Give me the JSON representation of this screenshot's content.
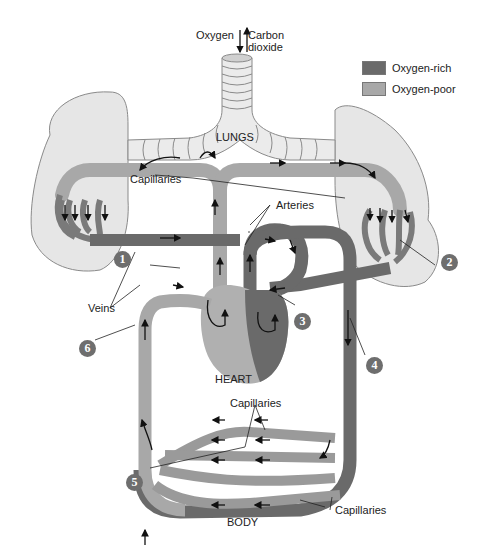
{
  "gas_exchange": {
    "oxygen_label": "Oxygen",
    "carbon_dioxide_label_line1": "Carbon",
    "carbon_dioxide_label_line2": "dioxide"
  },
  "legend": {
    "items": [
      {
        "label": "Oxygen-rich",
        "color": "#6a6a6a"
      },
      {
        "label": "Oxygen-poor",
        "color": "#a8a8a8"
      }
    ]
  },
  "labels": {
    "lungs": "LUNGS",
    "heart": "HEART",
    "body": "BODY",
    "capillaries_lungs": "Capillaries",
    "arteries": "Arteries",
    "veins": "Veins",
    "capillaries_body_top": "Capillaries",
    "capillaries_body_bottom": "Capillaries"
  },
  "steps": [
    {
      "number": "1"
    },
    {
      "number": "2"
    },
    {
      "number": "3"
    },
    {
      "number": "4"
    },
    {
      "number": "5"
    },
    {
      "number": "6"
    }
  ],
  "colors": {
    "oxygen_rich": "#6a6a6a",
    "oxygen_poor": "#a8a8a8",
    "lung_fill": "#e6e6e6",
    "outline": "#8a8a8a",
    "badge": "#6e6e6e"
  }
}
